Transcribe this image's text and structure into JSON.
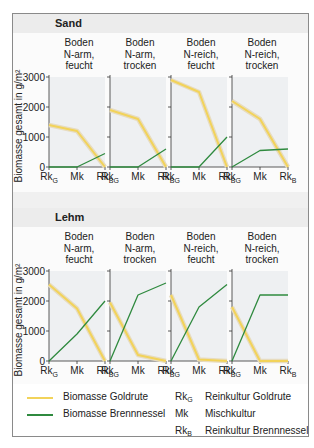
{
  "legend": {
    "goldrute_label": "Biomasse Goldrute",
    "brennnessel_label": "Biomasse Brennnessel",
    "abbr": [
      {
        "main": "Rk",
        "sub": "G",
        "text": "Reinkultur Goldrute"
      },
      {
        "main": "Mk",
        "sub": "",
        "text": "Mischkultur"
      },
      {
        "main": "Rk",
        "sub": "B",
        "text": "Reinkultur Brennnessel"
      }
    ]
  },
  "colors": {
    "goldrute": "#f2d35a",
    "goldrute_shadow": "#e7dcc0",
    "brennnessel": "#2f8a3f",
    "plot_bg": "#eef0f2"
  },
  "chart_data": {
    "type": "line",
    "ylabel": "Biomasse gesamt in g/m²",
    "ylim": [
      0,
      3000
    ],
    "yticks": [
      0,
      1000,
      2000,
      3000
    ],
    "categories": [
      "RkG",
      "Mk",
      "RkB"
    ],
    "sections": [
      {
        "title": "Sand",
        "panels": [
          {
            "title": [
              "Boden",
              "N-arm,",
              "feucht"
            ],
            "goldrute": [
              1400,
              1200,
              0
            ],
            "brennnessel": [
              0,
              0,
              450
            ]
          },
          {
            "title": [
              "Boden",
              "N-arm,",
              "trocken"
            ],
            "goldrute": [
              1900,
              1600,
              0
            ],
            "brennnessel": [
              0,
              0,
              600
            ]
          },
          {
            "title": [
              "Boden",
              "N-reich,",
              "feucht"
            ],
            "goldrute": [
              2900,
              2500,
              0
            ],
            "brennnessel": [
              0,
              0,
              1000
            ]
          },
          {
            "title": [
              "Boden",
              "N-reich,",
              "trocken"
            ],
            "goldrute": [
              2200,
              1600,
              0
            ],
            "brennnessel": [
              0,
              550,
              600
            ]
          }
        ]
      },
      {
        "title": "Lehm",
        "panels": [
          {
            "title": [
              "Boden",
              "N-arm,",
              "feucht"
            ],
            "goldrute": [
              2550,
              1750,
              0
            ],
            "brennnessel": [
              0,
              900,
              2000
            ]
          },
          {
            "title": [
              "Boden",
              "N-arm,",
              "trocken"
            ],
            "goldrute": [
              1950,
              200,
              0
            ],
            "brennnessel": [
              0,
              2200,
              2600
            ]
          },
          {
            "title": [
              "Boden",
              "N-reich,",
              "feucht"
            ],
            "goldrute": [
              2200,
              50,
              0
            ],
            "brennnessel": [
              0,
              1800,
              2550
            ]
          },
          {
            "title": [
              "Boden",
              "N-reich,",
              "trocken"
            ],
            "goldrute": [
              1800,
              0,
              0
            ],
            "brennnessel": [
              0,
              2200,
              2200
            ]
          }
        ]
      }
    ]
  }
}
